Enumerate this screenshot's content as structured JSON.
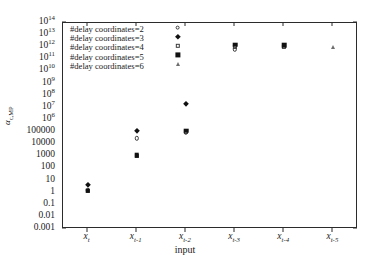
{
  "chart_data": {
    "type": "scatter",
    "title": "",
    "xlabel": "input",
    "ylabel": "αc,MP",
    "ylabel_base": "α",
    "ylabel_sub": "c,MP",
    "yscale": "log",
    "ylim": [
      0.001,
      100000000000000.0
    ],
    "grid": false,
    "legend_position": "top-left",
    "categories": [
      "x_t",
      "x_{t-1}",
      "x_{t-2}",
      "x_{t-3}",
      "x_{t-4}",
      "x_{t-5}"
    ],
    "x_tick_labels": [
      {
        "base": "x",
        "sub": "t"
      },
      {
        "base": "x",
        "sub": "t-1"
      },
      {
        "base": "x",
        "sub": "t-2"
      },
      {
        "base": "x",
        "sub": "t-3"
      },
      {
        "base": "x",
        "sub": "t-4"
      },
      {
        "base": "x",
        "sub": "t-5"
      }
    ],
    "y_tick_labels": [
      {
        "mantissa": "10",
        "exp": "14",
        "value": 100000000000000.0
      },
      {
        "mantissa": "10",
        "exp": "13",
        "value": 10000000000000.0
      },
      {
        "mantissa": "10",
        "exp": "12",
        "value": 1000000000000.0
      },
      {
        "mantissa": "10",
        "exp": "11",
        "value": 100000000000.0
      },
      {
        "mantissa": "10",
        "exp": "10",
        "value": 10000000000.0
      },
      {
        "mantissa": "10",
        "exp": "9",
        "value": 1000000000.0
      },
      {
        "mantissa": "10",
        "exp": "8",
        "value": 100000000.0
      },
      {
        "mantissa": "10",
        "exp": "7",
        "value": 10000000.0
      },
      {
        "mantissa": "10",
        "exp": "6",
        "value": 1000000.0
      },
      {
        "mantissa": "100000",
        "exp": "",
        "value": 100000
      },
      {
        "mantissa": "10000",
        "exp": "",
        "value": 10000
      },
      {
        "mantissa": "1000",
        "exp": "",
        "value": 1000
      },
      {
        "mantissa": "100",
        "exp": "",
        "value": 100
      },
      {
        "mantissa": "10",
        "exp": "",
        "value": 10
      },
      {
        "mantissa": "1",
        "exp": "",
        "value": 1
      },
      {
        "mantissa": "0.1",
        "exp": "",
        "value": 0.1
      },
      {
        "mantissa": "0.01",
        "exp": "",
        "value": 0.01
      },
      {
        "mantissa": "0.001",
        "exp": "",
        "value": 0.001
      }
    ],
    "series": [
      {
        "name": "#delay coordinates=2",
        "marker": "circle-open",
        "x": [
          "x_t",
          "x_{t-1}",
          "x_{t-2}",
          "x_{t-3}"
        ],
        "values": [
          1.6,
          30000,
          90000,
          700000000000
        ]
      },
      {
        "name": "#delay coordinates=3",
        "marker": "diamond-filled",
        "x": [
          "x_t",
          "x_{t-1}",
          "x_{t-2}"
        ],
        "values": [
          4.0,
          130000,
          20000000
        ]
      },
      {
        "name": "#delay coordinates=4",
        "marker": "square-open",
        "x": [
          "x_t",
          "x_{t-1}",
          "x_{t-2}",
          "x_{t-3}",
          "x_{t-4}"
        ],
        "values": [
          1.3,
          1100,
          110000,
          1000000000000,
          1000000000000
        ]
      },
      {
        "name": "#delay coordinates=5",
        "marker": "square-filled",
        "x": [
          "x_t",
          "x_{t-1}",
          "x_{t-2}",
          "x_{t-3}",
          "x_{t-4}"
        ],
        "values": [
          1.5,
          1300,
          130000,
          1600000000000,
          1500000000000
        ]
      },
      {
        "name": "#delay coordinates=6",
        "marker": "triangle-open",
        "x": [
          "x_{t-5}"
        ],
        "values": [
          1000000000000
        ]
      }
    ],
    "legend_entries": [
      {
        "label": "#delay coordinates=2",
        "marker": "circle-open"
      },
      {
        "label": "#delay coordinates=3",
        "marker": "diamond-filled"
      },
      {
        "label": "#delay coordinates=4",
        "marker": "square-open"
      },
      {
        "label": "#delay coordinates=5",
        "marker": "square-filled"
      },
      {
        "label": "#delay coordinates=6",
        "marker": "triangle-open"
      }
    ]
  }
}
